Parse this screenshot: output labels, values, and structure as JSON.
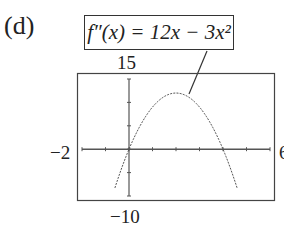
{
  "figure": {
    "part_label": "(d)",
    "function_label": "f″(x) = 12x − 3x²"
  },
  "chart_data": {
    "type": "line",
    "title": "f″(x) = 12x − 3x²",
    "function": "12x - 3x^2",
    "xlabel": "",
    "ylabel": "",
    "xlim": [
      -2,
      6
    ],
    "ylim": [
      -10,
      15
    ],
    "window_labels": {
      "xmin": "−2",
      "xmax": "6",
      "ymin": "−10",
      "ymax": "15"
    },
    "x_tick_step": 1,
    "y_tick_step": 5,
    "grid": false,
    "series": [
      {
        "name": "f''(x)",
        "x": [
          -0.6,
          -0.4,
          -0.2,
          0,
          0.5,
          1,
          1.5,
          2,
          2.5,
          3,
          3.5,
          4,
          4.5,
          4.6
        ],
        "values": [
          -8.28,
          -5.28,
          -2.52,
          0,
          5.25,
          9,
          11.25,
          12,
          11.25,
          9,
          5.25,
          0,
          -6.75,
          -8.28
        ]
      }
    ],
    "annotations": [
      {
        "text": "f″(x) = 12x − 3x²",
        "points_to": [
          2.8,
          11.5
        ]
      }
    ]
  }
}
